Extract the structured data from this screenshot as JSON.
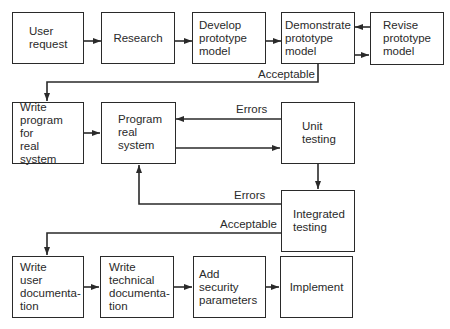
{
  "diagram": {
    "type": "flowchart",
    "nodes": [
      {
        "id": "user_request",
        "label": "User\nrequest"
      },
      {
        "id": "research",
        "label": "Research"
      },
      {
        "id": "develop_prototype",
        "label": "Develop\nprototype\nmodel"
      },
      {
        "id": "demonstrate_prototype",
        "label": "Demonstrate\nprototype\nmodel"
      },
      {
        "id": "revise_prototype",
        "label": "Revise\nprototype\nmodel"
      },
      {
        "id": "write_program",
        "label": "Write\nprogram for\nreal\nsystem"
      },
      {
        "id": "program_real_system",
        "label": "Program\nreal\nsystem"
      },
      {
        "id": "unit_testing",
        "label": "Unit\ntesting"
      },
      {
        "id": "integrated_testing",
        "label": "Integrated\ntesting"
      },
      {
        "id": "write_user_doc",
        "label": "Write\nuser\ndocumenta-\ntion"
      },
      {
        "id": "write_tech_doc",
        "label": "Write\ntechnical\ndocumenta-\ntion"
      },
      {
        "id": "add_security",
        "label": "Add security\nparameters"
      },
      {
        "id": "implement",
        "label": "Implement"
      }
    ],
    "edge_labels": {
      "acceptable_1": "Acceptable",
      "errors_unit": "Errors",
      "errors_integrated": "Errors",
      "acceptable_2": "Acceptable"
    },
    "edges": [
      {
        "from": "user_request",
        "to": "research"
      },
      {
        "from": "research",
        "to": "develop_prototype"
      },
      {
        "from": "develop_prototype",
        "to": "demonstrate_prototype"
      },
      {
        "from": "demonstrate_prototype",
        "to": "revise_prototype"
      },
      {
        "from": "revise_prototype",
        "to": "demonstrate_prototype"
      },
      {
        "from": "demonstrate_prototype",
        "to": "write_program",
        "label": "Acceptable"
      },
      {
        "from": "write_program",
        "to": "program_real_system"
      },
      {
        "from": "program_real_system",
        "to": "unit_testing"
      },
      {
        "from": "unit_testing",
        "to": "program_real_system",
        "label": "Errors"
      },
      {
        "from": "unit_testing",
        "to": "integrated_testing"
      },
      {
        "from": "integrated_testing",
        "to": "program_real_system",
        "label": "Errors"
      },
      {
        "from": "integrated_testing",
        "to": "write_user_doc",
        "label": "Acceptable"
      },
      {
        "from": "write_user_doc",
        "to": "write_tech_doc"
      },
      {
        "from": "write_tech_doc",
        "to": "add_security"
      },
      {
        "from": "add_security",
        "to": "implement"
      }
    ]
  }
}
